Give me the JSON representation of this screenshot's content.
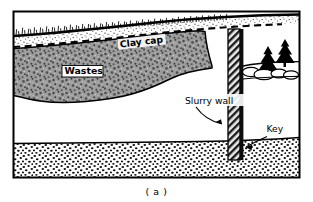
{
  "figure": {
    "caption": "( a )",
    "frame_color": "#000000",
    "background": "#ffffff"
  },
  "labels": {
    "clay_cap": "Clay cap",
    "wastes": "Wastes",
    "slurry_wall": "Slurry wall",
    "key": "Key"
  },
  "layers": {
    "cap_fill": "#ffffff",
    "waste_fill": "#9a9a9a",
    "aquifer_fill": "#ffffff",
    "aquitard_fill": "#ffffff",
    "wall_fill": "#4a4a4a",
    "line_color": "#000000"
  },
  "elements": {
    "ground_surface": "ground-surface-line",
    "clay_cap_line": "clay-cap-dashed-line",
    "waste_mass": "waste-mass-body",
    "slurry_wall": "slurry-wall-column",
    "aquitard": "aquitard-stipple-layer",
    "trees": "conifer-trees",
    "shrubs": "shrub-cluster",
    "leader_slurry": "slurry-wall-leader-arrow",
    "leader_key": "key-leader-arrow"
  }
}
